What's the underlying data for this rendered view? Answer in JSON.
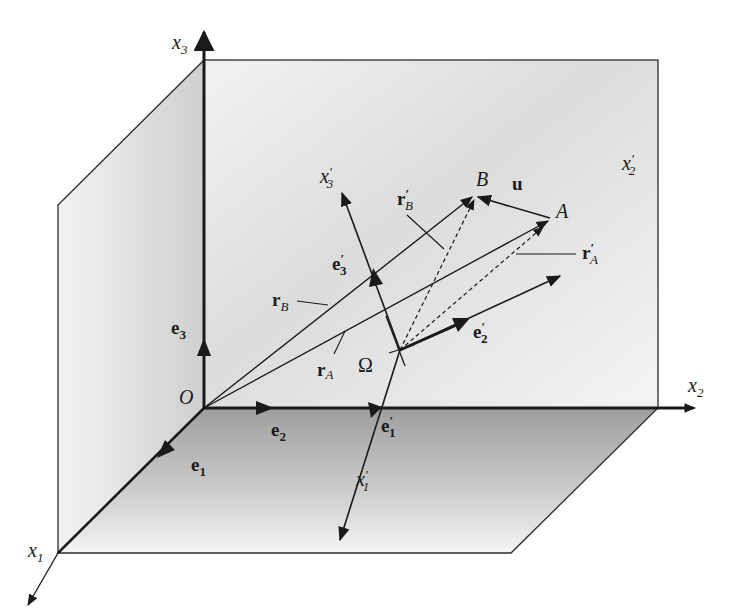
{
  "figure": {
    "type": "3D coordinate frame diagram",
    "colors": {
      "background": "#ffffff",
      "wall_fill": "#d9d9d9",
      "floor_fill": "#a9a9a9",
      "line": "#1a1a1a"
    },
    "axes": {
      "x1": {
        "base": "x",
        "sub": "1",
        "prime": ""
      },
      "x2": {
        "base": "x",
        "sub": "2",
        "prime": ""
      },
      "x3": {
        "base": "x",
        "sub": "3",
        "prime": ""
      },
      "x1p": {
        "base": "x",
        "sub": "1",
        "prime": "′"
      },
      "x2p": {
        "base": "x",
        "sub": "2",
        "prime": "′"
      },
      "x3p": {
        "base": "x",
        "sub": "3",
        "prime": "′"
      }
    },
    "unit_vectors": {
      "e1": {
        "base": "e",
        "sub": "1",
        "prime": ""
      },
      "e2": {
        "base": "e",
        "sub": "2",
        "prime": ""
      },
      "e3": {
        "base": "e",
        "sub": "3",
        "prime": ""
      },
      "e1p": {
        "base": "e",
        "sub": "1",
        "prime": "′"
      },
      "e2p": {
        "base": "e",
        "sub": "2",
        "prime": "′"
      },
      "e3p": {
        "base": "e",
        "sub": "3",
        "prime": "′"
      }
    },
    "points": {
      "origin": "O",
      "omega": "Ω",
      "A": "A",
      "B": "B"
    },
    "position_vectors": {
      "rA": {
        "base": "r",
        "sub": "A",
        "prime": ""
      },
      "rB": {
        "base": "r",
        "sub": "B",
        "prime": ""
      },
      "rAp": {
        "base": "r",
        "sub": "A",
        "prime": "′"
      },
      "rBp": {
        "base": "r",
        "sub": "B",
        "prime": "′"
      }
    },
    "displacement": {
      "u": "u"
    }
  }
}
